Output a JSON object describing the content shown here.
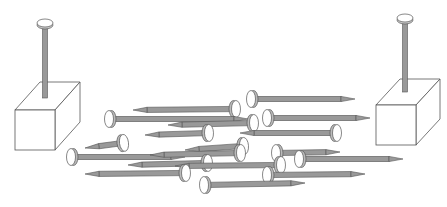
{
  "figure": {
    "colors": {
      "background": "#ffffff",
      "outline": "#555555",
      "shaft": "#999999",
      "head_fill": "#ffffff"
    },
    "blocks": [
      {
        "name": "left-block",
        "x": 15,
        "y": 110,
        "size": 40,
        "depth_dx": 25,
        "depth_dy": -28,
        "nail_x": 45,
        "head_y": 23,
        "shaft_bottom": 98
      },
      {
        "name": "right-block",
        "x": 376,
        "y": 105,
        "size": 40,
        "depth_dx": 24,
        "depth_dy": -26,
        "nail_x": 405,
        "head_y": 18,
        "shaft_bottom": 92
      }
    ],
    "loose_nails": [
      {
        "hx": 252,
        "hy": 99,
        "tx": 355,
        "ty": 99
      },
      {
        "hx": 235,
        "hy": 109,
        "tx": 133,
        "ty": 110
      },
      {
        "hx": 110,
        "hy": 119,
        "tx": 248,
        "ty": 119
      },
      {
        "hx": 268,
        "hy": 118,
        "tx": 370,
        "ty": 118
      },
      {
        "hx": 253,
        "hy": 123,
        "tx": 168,
        "ty": 125
      },
      {
        "hx": 208,
        "hy": 133,
        "tx": 145,
        "ty": 135
      },
      {
        "hx": 336,
        "hy": 133,
        "tx": 240,
        "ty": 133
      },
      {
        "hx": 123,
        "hy": 143,
        "tx": 85,
        "ty": 148
      },
      {
        "hx": 243,
        "hy": 146,
        "tx": 185,
        "ty": 150
      },
      {
        "hx": 72,
        "hy": 157,
        "tx": 185,
        "ty": 157
      },
      {
        "hx": 240,
        "hy": 153,
        "tx": 150,
        "ty": 155
      },
      {
        "hx": 277,
        "hy": 153,
        "tx": 340,
        "ty": 152
      },
      {
        "hx": 300,
        "hy": 159,
        "tx": 403,
        "ty": 159
      },
      {
        "hx": 207,
        "hy": 163,
        "tx": 128,
        "ty": 165
      },
      {
        "hx": 280,
        "hy": 165,
        "tx": 175,
        "ty": 166
      },
      {
        "hx": 185,
        "hy": 173,
        "tx": 85,
        "ty": 174
      },
      {
        "hx": 268,
        "hy": 175,
        "tx": 365,
        "ty": 174
      },
      {
        "hx": 205,
        "hy": 185,
        "tx": 305,
        "ty": 183
      }
    ]
  }
}
